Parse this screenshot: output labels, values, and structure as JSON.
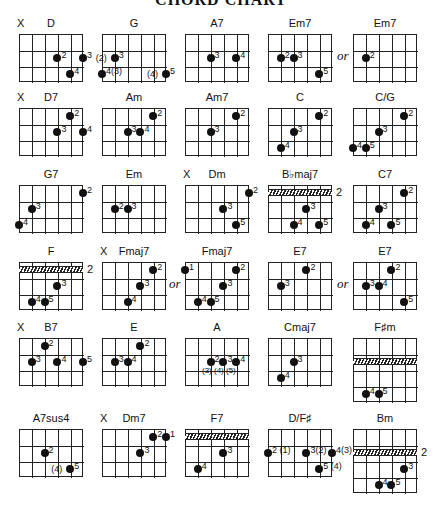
{
  "title": "CHORD CHART",
  "or_label": "or",
  "chords": [
    {
      "name": "D",
      "mute": "X",
      "x": 19,
      "y": 34,
      "rows": 3,
      "dots": [
        [
          3,
          1,
          "2"
        ],
        [
          5,
          1,
          "3"
        ],
        [
          4,
          2,
          "4"
        ]
      ]
    },
    {
      "name": "G",
      "x": 102,
      "y": 34,
      "rows": 3,
      "dots": [
        [
          1,
          1,
          "3",
          "(2)"
        ],
        [
          0,
          2,
          "4(3)"
        ],
        [
          5,
          2,
          "5",
          "(4)"
        ]
      ]
    },
    {
      "name": "A7",
      "x": 185,
      "y": 34,
      "rows": 3,
      "dots": [
        [
          2,
          1,
          "3"
        ],
        [
          4,
          1,
          "4"
        ]
      ]
    },
    {
      "name": "Em7",
      "x": 268,
      "y": 34,
      "rows": 3,
      "dots": [
        [
          1,
          1,
          "2"
        ],
        [
          2,
          1,
          "3"
        ],
        [
          4,
          2,
          "5"
        ]
      ]
    },
    {
      "name": "Em7",
      "x": 353,
      "y": 34,
      "rows": 3,
      "or": true,
      "dots": [
        [
          1,
          1,
          "2"
        ]
      ]
    },
    {
      "name": "D7",
      "mute": "X",
      "x": 19,
      "y": 108,
      "rows": 3,
      "dots": [
        [
          4,
          0,
          "2"
        ],
        [
          3,
          1,
          "3"
        ],
        [
          5,
          1,
          "4"
        ]
      ]
    },
    {
      "name": "Am",
      "x": 102,
      "y": 108,
      "rows": 3,
      "dots": [
        [
          4,
          0,
          "2"
        ],
        [
          2,
          1,
          "3"
        ],
        [
          3,
          1,
          "4"
        ]
      ]
    },
    {
      "name": "Am7",
      "x": 185,
      "y": 108,
      "rows": 3,
      "dots": [
        [
          4,
          0,
          "2"
        ],
        [
          2,
          1,
          "3"
        ]
      ]
    },
    {
      "name": "C",
      "x": 268,
      "y": 108,
      "rows": 3,
      "dots": [
        [
          4,
          0,
          "2"
        ],
        [
          2,
          1,
          "3"
        ],
        [
          1,
          2,
          "4"
        ]
      ]
    },
    {
      "name": "C/G",
      "x": 353,
      "y": 108,
      "rows": 3,
      "dots": [
        [
          4,
          0,
          "2"
        ],
        [
          2,
          1,
          "3"
        ],
        [
          0,
          2,
          "4"
        ],
        [
          1,
          2,
          "5"
        ]
      ]
    },
    {
      "name": "G7",
      "x": 19,
      "y": 185,
      "rows": 3,
      "dots": [
        [
          5,
          0,
          "2"
        ],
        [
          1,
          1,
          "3"
        ],
        [
          0,
          2,
          "4"
        ]
      ]
    },
    {
      "name": "Em",
      "x": 102,
      "y": 185,
      "rows": 3,
      "dots": [
        [
          1,
          1,
          "2"
        ],
        [
          2,
          1,
          "3"
        ]
      ]
    },
    {
      "name": "Dm",
      "mute": "X",
      "x": 185,
      "y": 185,
      "rows": 3,
      "dots": [
        [
          5,
          0,
          "2"
        ],
        [
          3,
          1,
          "3"
        ],
        [
          4,
          2,
          "5"
        ]
      ]
    },
    {
      "name": "B♭maj7",
      "x": 268,
      "y": 185,
      "rows": 3,
      "barre": 0,
      "fret": "2",
      "dots": [
        [
          3,
          1,
          "3"
        ],
        [
          2,
          2,
          "4"
        ],
        [
          4,
          2,
          "5"
        ]
      ]
    },
    {
      "name": "C7",
      "x": 353,
      "y": 185,
      "rows": 3,
      "dots": [
        [
          4,
          0,
          "2"
        ],
        [
          2,
          1,
          "3"
        ],
        [
          1,
          2,
          "4"
        ],
        [
          3,
          2,
          "5"
        ]
      ]
    },
    {
      "name": "F",
      "x": 19,
      "y": 262,
      "rows": 3,
      "barre": 0,
      "fret": "2",
      "dots": [
        [
          3,
          1,
          "3"
        ],
        [
          1,
          2,
          "4"
        ],
        [
          2,
          2,
          "5"
        ]
      ]
    },
    {
      "name": "Fmaj7",
      "mute": "X",
      "x": 102,
      "y": 262,
      "rows": 3,
      "dots": [
        [
          4,
          0,
          "2"
        ],
        [
          3,
          1,
          "3"
        ],
        [
          2,
          2,
          "4"
        ]
      ]
    },
    {
      "name": "Fmaj7",
      "x": 185,
      "y": 262,
      "rows": 3,
      "or": true,
      "dots": [
        [
          0,
          0,
          "1"
        ],
        [
          4,
          0,
          "2"
        ],
        [
          3,
          1,
          "3"
        ],
        [
          1,
          2,
          "4"
        ],
        [
          2,
          2,
          "5"
        ]
      ]
    },
    {
      "name": "E7",
      "x": 268,
      "y": 262,
      "rows": 3,
      "dots": [
        [
          3,
          0,
          "2"
        ],
        [
          1,
          1,
          "3"
        ]
      ]
    },
    {
      "name": "E7",
      "x": 353,
      "y": 262,
      "rows": 3,
      "or": true,
      "dots": [
        [
          3,
          0,
          "2"
        ],
        [
          1,
          1,
          "3"
        ],
        [
          2,
          1,
          "4"
        ],
        [
          4,
          2,
          "5"
        ]
      ]
    },
    {
      "name": "B7",
      "mute": "X",
      "x": 19,
      "y": 338,
      "rows": 3,
      "dots": [
        [
          2,
          0,
          "2"
        ],
        [
          1,
          1,
          "3"
        ],
        [
          3,
          1,
          "4"
        ],
        [
          5,
          1,
          "5"
        ]
      ]
    },
    {
      "name": "E",
      "x": 102,
      "y": 338,
      "rows": 3,
      "dots": [
        [
          3,
          0,
          "2"
        ],
        [
          1,
          1,
          "3"
        ],
        [
          2,
          1,
          "4"
        ]
      ]
    },
    {
      "name": "A",
      "x": 185,
      "y": 338,
      "rows": 3,
      "dots": [
        [
          2,
          1,
          "2"
        ],
        [
          3,
          1,
          "3"
        ],
        [
          4,
          1,
          "4"
        ]
      ],
      "sub": "(3)  (4)  (5)"
    },
    {
      "name": "Cmaj7",
      "x": 268,
      "y": 338,
      "rows": 3,
      "dots": [
        [
          2,
          1,
          "3"
        ],
        [
          1,
          2,
          "4"
        ]
      ]
    },
    {
      "name": "F♯m",
      "x": 353,
      "y": 338,
      "rows": 4,
      "barre": 1,
      "dots": [
        [
          1,
          3,
          "4"
        ],
        [
          2,
          3,
          "5"
        ]
      ]
    },
    {
      "name": "A7sus4",
      "x": 19,
      "y": 429,
      "rows": 3,
      "dots": [
        [
          2,
          1,
          "2"
        ],
        [
          4,
          2,
          "5",
          "(4)"
        ]
      ]
    },
    {
      "name": "Dm7",
      "mute": "X",
      "x": 102,
      "y": 429,
      "rows": 3,
      "dots": [
        [
          4,
          0,
          "2"
        ],
        [
          5,
          0,
          "1"
        ],
        [
          3,
          1,
          "3"
        ]
      ]
    },
    {
      "name": "F7",
      "x": 185,
      "y": 429,
      "rows": 3,
      "barre": 0,
      "dots": [
        [
          3,
          1,
          "3"
        ],
        [
          1,
          2,
          "4"
        ]
      ]
    },
    {
      "name": "D/F♯",
      "x": 268,
      "y": 429,
      "rows": 3,
      "dots": [
        [
          0,
          1,
          "2 (1)"
        ],
        [
          3,
          1,
          "3(2)"
        ],
        [
          5,
          1,
          "4(3)"
        ],
        [
          4,
          2,
          "5 (4)"
        ]
      ]
    },
    {
      "name": "Bm",
      "x": 353,
      "y": 429,
      "rows": 4,
      "barre": 1,
      "fret": "2",
      "dots": [
        [
          4,
          2,
          "3"
        ],
        [
          2,
          3,
          "4"
        ],
        [
          3,
          3,
          "5"
        ]
      ]
    }
  ]
}
